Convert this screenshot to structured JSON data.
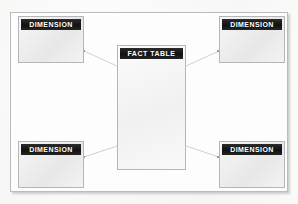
{
  "diagram": {
    "type": "star-schema",
    "frame_color": "#b9bbbd",
    "node_fill": "#ebebeb",
    "header_fill": "#1d1d1d",
    "header_text_color": "#ffffff",
    "link_color": "#c9cbcd",
    "background": "#fbfbfa"
  },
  "fact_table": {
    "label": "FACT TABLE",
    "body_text": ""
  },
  "dimensions": [
    {
      "id": "top-left",
      "label": "DIMENSION",
      "body_text": ""
    },
    {
      "id": "top-right",
      "label": "DIMENSION",
      "body_text": ""
    },
    {
      "id": "bottom-left",
      "label": "DIMENSION",
      "body_text": ""
    },
    {
      "id": "bottom-right",
      "label": "DIMENSION",
      "body_text": ""
    }
  ],
  "links": [
    {
      "from": "top-left",
      "to": "fact-table"
    },
    {
      "from": "top-right",
      "to": "fact-table"
    },
    {
      "from": "bottom-left",
      "to": "fact-table"
    },
    {
      "from": "bottom-right",
      "to": "fact-table"
    }
  ]
}
